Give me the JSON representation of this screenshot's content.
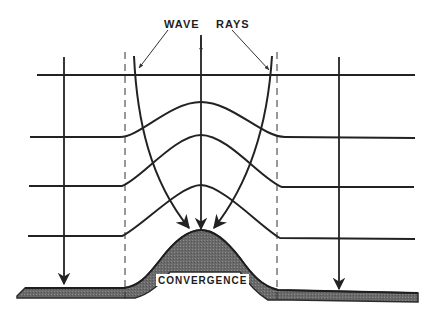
{
  "diagram": {
    "title_labels": {
      "left": "WAVE",
      "right": "RAYS"
    },
    "bump_label": "CONVERGENCE",
    "colors": {
      "ink": "#2a2a2a",
      "seafloor_fill": "#6e6e6e",
      "background": "#ffffff"
    },
    "elements": {
      "wave_crests": 4,
      "wave_rays": 3,
      "straight_rays": 2,
      "dashed_guides": 2
    }
  }
}
